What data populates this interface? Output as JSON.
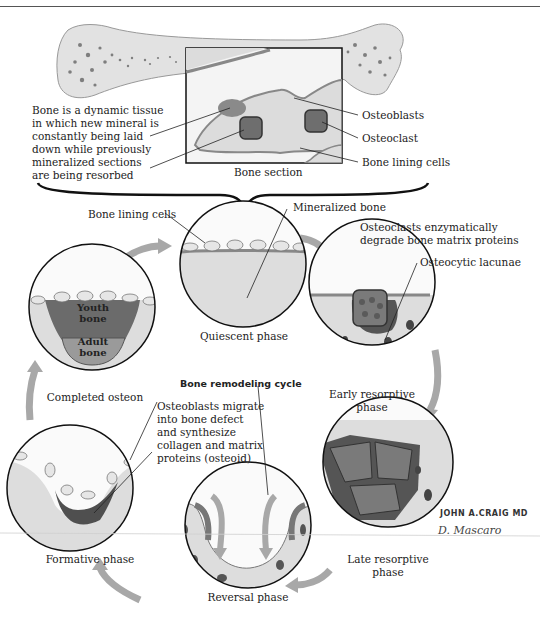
{
  "figure": {
    "title": "Bone remodeling cycle",
    "top_panel": {
      "description_text": [
        "Bone is a dynamic tissue",
        "in which new mineral is",
        "constantly being laid",
        "down while previously",
        "mineralized sections",
        "are being resorbed"
      ],
      "inset_caption": "Bone section",
      "callouts": [
        "Osteoblasts",
        "Osteoclast",
        "Bone lining cells"
      ]
    },
    "phases": [
      {
        "name": "Quiescent phase",
        "labels": [
          "Bone lining cells",
          "Mineralized bone"
        ]
      },
      {
        "name": "Early resorptive phase",
        "line1": "Early resorptive",
        "line2": "phase",
        "labels": [
          "Osteoclasts enzymatically",
          "degrade bone matrix proteins",
          "Osteocytic lacunae"
        ]
      },
      {
        "name": "Late resorptive phase",
        "line1": "Late resorptive",
        "line2": "phase"
      },
      {
        "name": "Reversal phase"
      },
      {
        "name": "Formative phase",
        "labels": [
          "Osteoblasts migrate",
          "into bone defect",
          "and synthesize",
          "collagen and matrix",
          "proteins (osteoid)"
        ]
      },
      {
        "name": "Completed osteon",
        "inner_labels": {
          "youth": [
            "Youth",
            "bone"
          ],
          "adult": [
            "Adult",
            "bone"
          ]
        }
      }
    ],
    "signatures": {
      "artist1": "JOHN A.CRAIG MD",
      "artist2": "D. Mascaro"
    },
    "colors": {
      "bone_fill": "#dedede",
      "bone_dark": "#5a5a5a",
      "youth_bone": "#6b6b6b",
      "adult_bone": "#9a9a9a",
      "arrow": "#a8a8a8",
      "outline": "#111111"
    }
  }
}
